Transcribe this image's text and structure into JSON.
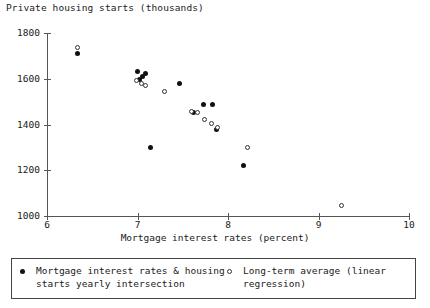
{
  "chart_data": {
    "type": "scatter",
    "title": "Private housing starts (thousands)",
    "xlabel": "Mortgage interest rates (percent)",
    "ylabel": "Private housing starts (thousands)",
    "xlim": [
      6,
      10
    ],
    "ylim": [
      1000,
      1800
    ],
    "xticks": [
      "6",
      "7",
      "8",
      "9",
      "10"
    ],
    "yticks": [
      "1000",
      "1200",
      "1400",
      "1600",
      "1800"
    ],
    "grid": false,
    "legend_position": "below-axes",
    "series": [
      {
        "name": "Mortgage interest rates & housing\nstarts yearly intersection",
        "marker": "filled-circle",
        "color": "#111111",
        "points": [
          {
            "x": 6.34,
            "y": 1712
          },
          {
            "x": 7.0,
            "y": 1630
          },
          {
            "x": 7.05,
            "y": 1610
          },
          {
            "x": 7.02,
            "y": 1597
          },
          {
            "x": 7.09,
            "y": 1622
          },
          {
            "x": 7.46,
            "y": 1580
          },
          {
            "x": 7.14,
            "y": 1300
          },
          {
            "x": 7.73,
            "y": 1487
          },
          {
            "x": 7.83,
            "y": 1487
          },
          {
            "x": 7.87,
            "y": 1378
          },
          {
            "x": 7.62,
            "y": 1452
          },
          {
            "x": 8.17,
            "y": 1220
          }
        ]
      },
      {
        "name": "Long-term average (linear\nregression)",
        "marker": "open-circle",
        "color": "#333333",
        "points": [
          {
            "x": 6.34,
            "y": 1737
          },
          {
            "x": 6.99,
            "y": 1593
          },
          {
            "x": 7.04,
            "y": 1578
          },
          {
            "x": 7.09,
            "y": 1572
          },
          {
            "x": 7.3,
            "y": 1543
          },
          {
            "x": 7.6,
            "y": 1457
          },
          {
            "x": 7.66,
            "y": 1452
          },
          {
            "x": 7.74,
            "y": 1424
          },
          {
            "x": 7.82,
            "y": 1405
          },
          {
            "x": 7.88,
            "y": 1388
          },
          {
            "x": 8.22,
            "y": 1300
          },
          {
            "x": 9.25,
            "y": 1045
          }
        ]
      }
    ]
  },
  "legend": {
    "entries": [
      {
        "marker": "filled-circle",
        "label": "Mortgage interest rates & housing\nstarts yearly intersection"
      },
      {
        "marker": "open-circle",
        "label": "Long-term average (linear\nregression)"
      }
    ]
  }
}
